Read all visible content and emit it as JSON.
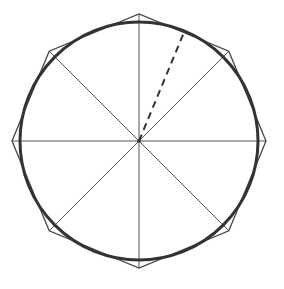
{
  "diagram": {
    "type": "geometry",
    "canvas": {
      "width": 284,
      "height": 289
    },
    "center": {
      "x": 139,
      "y": 141
    },
    "circle": {
      "radius": 119,
      "stroke": "#333333",
      "stroke_width": 3
    },
    "octagon": {
      "vertex_radius": 127,
      "vertex_angles_deg": [
        0,
        45,
        90,
        135,
        180,
        225,
        270,
        315
      ],
      "stroke": "#444444",
      "stroke_width": 1.3
    },
    "spokes": {
      "count": 8,
      "angles_deg": [
        0,
        45,
        90,
        135,
        180,
        225,
        270,
        315
      ],
      "length_to": "octagon_vertex",
      "stroke": "#555555",
      "stroke_width": 1
    },
    "dashed_radius": {
      "angle_deg_from_vertical": 22.5,
      "length": 119,
      "stroke": "#333333",
      "stroke_width": 2,
      "dash": "7,5"
    },
    "labels": []
  }
}
